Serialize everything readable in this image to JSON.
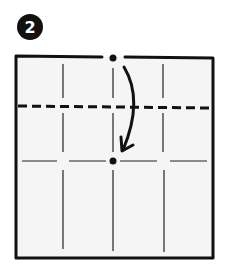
{
  "diagram": {
    "type": "origami-step",
    "step_number": "2",
    "instruction": "Fold top edge down so the top center point meets the center point",
    "colors": {
      "ink": "#111111",
      "paper": "#f5f5f5",
      "badge_text": "#ffffff"
    },
    "paper_square": {
      "x": 16,
      "y": 57,
      "width": 197,
      "height": 201
    },
    "valley_fold_line": {
      "y": 106,
      "style": "dashed"
    },
    "creases": {
      "vertical_x": [
        63,
        113,
        164
      ],
      "horizontal_y": [
        161
      ]
    },
    "points": [
      {
        "name": "top-center",
        "x": 113,
        "y": 58
      },
      {
        "name": "center",
        "x": 113,
        "y": 160
      }
    ],
    "arrow": {
      "from": "top-center",
      "to": "center",
      "direction": "down"
    }
  }
}
